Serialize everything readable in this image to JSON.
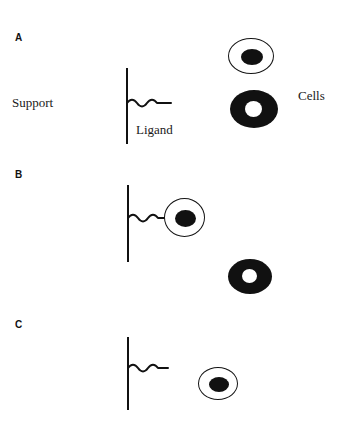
{
  "figure": {
    "background_color": "#ffffff",
    "ink_color": "#111111"
  },
  "annotations": {
    "support": "Support",
    "ligand": "Ligand",
    "cells": "Cells"
  },
  "panels": [
    {
      "label": "A",
      "description": "Cells in suspension, not yet bound to the immobilized ligand on the support",
      "support": {
        "label": "Support"
      },
      "ligand": {
        "label": "Ligand",
        "bound": "false"
      },
      "cells": [
        {
          "type": "outlined-cell",
          "state": "unbound"
        },
        {
          "type": "donut-cell",
          "state": "unbound"
        }
      ]
    },
    {
      "label": "B",
      "description": "One cell type binds the ligand and becomes attached to the support; the other cell type remains free",
      "support": {
        "label": "Support"
      },
      "ligand": {
        "label": "Ligand",
        "bound": "true"
      },
      "cells": [
        {
          "type": "outlined-cell",
          "state": "bound"
        },
        {
          "type": "donut-cell",
          "state": "unbound"
        }
      ]
    },
    {
      "label": "C",
      "description": "Unbound cells are washed away; the remaining cell is released from the ligand",
      "support": {
        "label": "Support"
      },
      "ligand": {
        "label": "Ligand",
        "bound": "false"
      },
      "cells": [
        {
          "type": "outlined-cell",
          "state": "unbound"
        }
      ]
    }
  ]
}
